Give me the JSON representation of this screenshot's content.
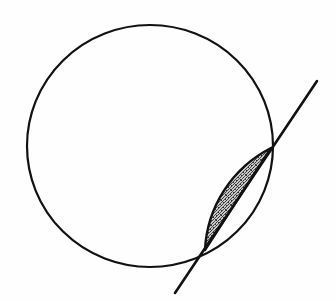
{
  "figure": {
    "title": "Circle with secant line and shaded circular segment",
    "background_color": "#fefefe",
    "stroke_color": "#111111",
    "fill_color": "#8a8a8a",
    "canvas": {
      "width": 336,
      "height": 301
    },
    "circle": {
      "label": "circle",
      "center_x": 150,
      "center_y": 146,
      "radius_x": 123,
      "radius_y": 121,
      "stroke_width": 2.2,
      "fill": "none"
    },
    "secant_line": {
      "label": "secant line",
      "x1": 175,
      "y1": 293,
      "x2": 317,
      "y2": 81,
      "stroke_width": 2.6
    },
    "intersections": [
      {
        "label": "lower intersection point",
        "x": 205,
        "y": 250
      },
      {
        "label": "upper intersection point",
        "x": 271,
        "y": 148
      }
    ],
    "shaded_segment": {
      "label": "shaded circular segment",
      "chord_start_x": 205,
      "chord_start_y": 250,
      "chord_end_x": 271,
      "chord_end_y": 148,
      "arc_bulge_px": 22,
      "stroke_width": 2.4,
      "fill_pattern": "gray-dither-stipple"
    }
  }
}
